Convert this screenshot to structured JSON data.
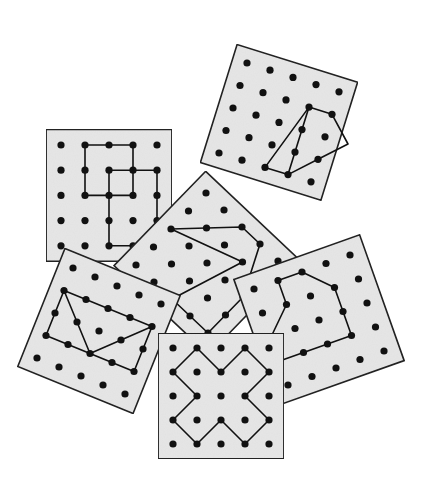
{
  "figure": {
    "colors": {
      "board_fill": "#e6e6e6",
      "board_stroke": "#222222",
      "peg": "#111111",
      "band": "#111111",
      "background": "#ffffff"
    },
    "grid_size": 5,
    "boards": [
      {
        "id": "board-b-grid-path",
        "origin": [
          61,
          145
        ],
        "u": [
          24,
          0
        ],
        "v": [
          0,
          25.2
        ],
        "shape_paths": [
          [
            [
              1,
              0
            ],
            [
              2,
              0
            ],
            [
              3,
              0
            ],
            [
              3,
              1
            ],
            [
              3,
              2
            ],
            [
              2,
              2
            ],
            [
              1,
              2
            ],
            [
              1,
              1
            ],
            [
              1,
              0
            ]
          ],
          [
            [
              2,
              1
            ],
            [
              3,
              1
            ],
            [
              4,
              1
            ],
            [
              4,
              2
            ],
            [
              4,
              3
            ],
            [
              4,
              4
            ]
          ],
          [
            [
              2,
              1
            ],
            [
              2,
              2
            ],
            [
              2,
              3
            ],
            [
              2,
              4
            ],
            [
              3,
              4
            ]
          ]
        ]
      },
      {
        "id": "board-a-quadrilateral",
        "origin": [
          247,
          63
        ],
        "u": [
          23,
          7.2
        ],
        "v": [
          -7,
          22.5
        ],
        "shape_paths": [
          [
            [
              3,
              1
            ],
            [
              4,
              1
            ],
            [
              5,
              2
            ],
            [
              4,
              3
            ],
            [
              3,
              4
            ],
            [
              2,
              4
            ],
            [
              3,
              1
            ]
          ],
          [
            [
              3,
              1
            ],
            [
              3,
              2
            ],
            [
              3,
              4
            ]
          ]
        ]
      },
      {
        "id": "board-c-w-path",
        "origin": [
          206,
          193
        ],
        "u": [
          18,
          17
        ],
        "v": [
          -17.5,
          18
        ],
        "shape_paths": [
          [
            [
              2,
              0
            ],
            [
              1,
              1
            ],
            [
              0,
              2
            ],
            [
              3,
              1
            ],
            [
              2,
              4
            ],
            [
              3,
              4
            ],
            [
              4,
              4
            ],
            [
              4,
              3
            ],
            [
              4,
              2
            ],
            [
              3,
              0
            ],
            [
              2,
              0
            ]
          ]
        ]
      },
      {
        "id": "board-d-triangles",
        "origin": [
          73,
          268
        ],
        "u": [
          22,
          9
        ],
        "v": [
          -9,
          22.5
        ],
        "shape_paths": [
          [
            [
              0,
              1
            ],
            [
              1,
              1
            ],
            [
              2,
              1
            ],
            [
              3,
              1
            ],
            [
              4,
              1
            ],
            [
              4,
              2
            ],
            [
              4,
              3
            ],
            [
              3,
              3
            ],
            [
              2,
              3
            ],
            [
              1,
              3
            ],
            [
              0,
              3
            ],
            [
              0,
              2
            ],
            [
              0,
              1
            ]
          ],
          [
            [
              0,
              1
            ],
            [
              1,
              2
            ],
            [
              2,
              3
            ],
            [
              3,
              2
            ],
            [
              4,
              1
            ]
          ]
        ]
      },
      {
        "id": "board-e-hexagon",
        "origin": [
          254,
          289
        ],
        "u": [
          24,
          -8.5
        ],
        "v": [
          8.5,
          24
        ],
        "shape_paths": [
          [
            [
              1,
              0
            ],
            [
              2,
              0
            ],
            [
              3,
              1
            ],
            [
              3,
              2
            ],
            [
              3,
              3
            ],
            [
              2,
              3
            ],
            [
              1,
              3
            ],
            [
              0,
              3
            ],
            [
              0,
              2
            ],
            [
              1,
              1
            ],
            [
              1,
              0
            ]
          ]
        ]
      },
      {
        "id": "board-f-x-path",
        "origin": [
          173,
          348
        ],
        "u": [
          24,
          0
        ],
        "v": [
          0,
          24
        ],
        "shape_paths": [
          [
            [
              0,
              1
            ],
            [
              1,
              0
            ],
            [
              2,
              1
            ],
            [
              3,
              0
            ],
            [
              4,
              1
            ],
            [
              3,
              2
            ],
            [
              4,
              3
            ],
            [
              3,
              4
            ],
            [
              2,
              3
            ],
            [
              1,
              4
            ],
            [
              0,
              3
            ],
            [
              1,
              2
            ],
            [
              0,
              1
            ]
          ]
        ]
      }
    ]
  }
}
